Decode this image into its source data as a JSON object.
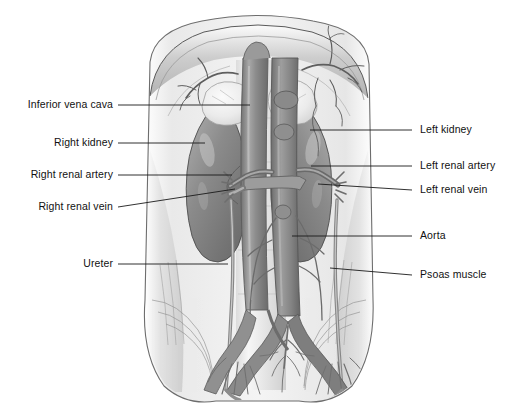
{
  "figure": {
    "style": "grayscale medical illustration",
    "background_color": "#ffffff",
    "label_color": "#111111",
    "leader_color": "#1a1a1a"
  },
  "labels": {
    "left": [
      {
        "name": "inferior-vena-cava",
        "text": "Inferior vena cava"
      },
      {
        "name": "right-kidney",
        "text": "Right kidney"
      },
      {
        "name": "right-renal-artery",
        "text": "Right renal artery"
      },
      {
        "name": "right-renal-vein",
        "text": "Right renal vein"
      },
      {
        "name": "ureter",
        "text": "Ureter"
      }
    ],
    "right": [
      {
        "name": "left-kidney",
        "text": "Left kidney"
      },
      {
        "name": "left-renal-artery",
        "text": "Left renal artery"
      },
      {
        "name": "left-renal-vein",
        "text": "Left renal vein"
      },
      {
        "name": "aorta",
        "text": "Aorta"
      },
      {
        "name": "psoas-muscle",
        "text": "Psoas muscle"
      }
    ]
  },
  "structures": [
    "diaphragm",
    "right kidney",
    "left kidney",
    "right adrenal gland",
    "left adrenal gland",
    "inferior vena cava",
    "abdominal aorta",
    "right renal artery",
    "left renal artery",
    "right renal vein",
    "left renal vein",
    "right ureter",
    "left ureter",
    "psoas muscle",
    "common iliac vessels",
    "lumbar vessels"
  ],
  "palette": {
    "kidney": "#8b8b8b",
    "kidney_dark": "#6f6f6f",
    "kidney_light": "#b4b4b4",
    "vessel": "#8e8e8e",
    "vessel_dark": "#6a6a6a",
    "adrenal": "#ededed",
    "muscle": "#d8d8d8",
    "muscle_light": "#f0f0f0",
    "outline": "#4a4a4a"
  }
}
